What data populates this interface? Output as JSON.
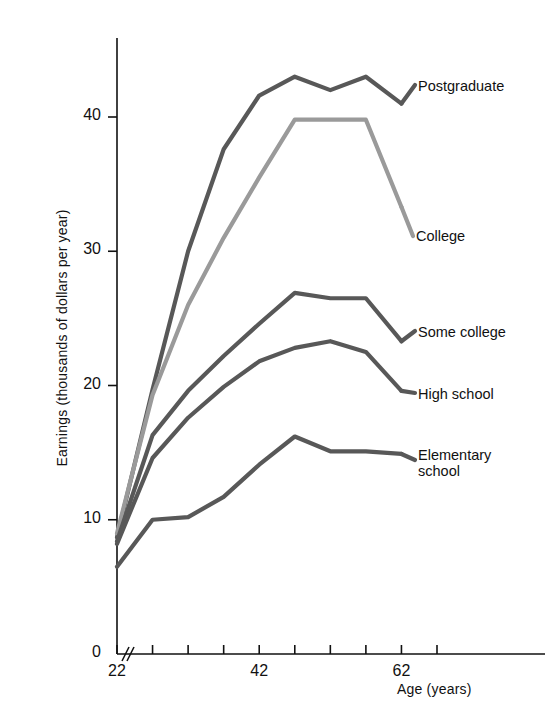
{
  "chart_data": {
    "type": "line",
    "title": "",
    "xlabel": "Age (years)",
    "ylabel": "Earnings (thousands of dollars per year)",
    "xlim": [
      22,
      67
    ],
    "ylim": [
      0,
      46
    ],
    "xticks": [
      22,
      27,
      32,
      37,
      42,
      47,
      52,
      57,
      62,
      67
    ],
    "xtick_labels": [
      "22",
      "",
      "",
      "",
      "42",
      "",
      "",
      "",
      "62",
      ""
    ],
    "yticks": [
      0,
      10,
      20,
      30,
      40
    ],
    "ytick_labels": [
      "0",
      "10",
      "20",
      "30",
      "40"
    ],
    "grid": false,
    "legend_position": "right-inline-labels",
    "axis_break": "//",
    "x": [
      22,
      27,
      32,
      37,
      42,
      47,
      52,
      57,
      62
    ],
    "series": [
      {
        "name": "Postgraduate",
        "color": "#585858",
        "values": [
          8.7,
          19.7,
          30.0,
          37.6,
          41.6,
          43.0,
          42.0,
          43.0,
          41.0
        ]
      },
      {
        "name": "College",
        "color": "#9a9a9a",
        "values": [
          9.0,
          19.3,
          26.0,
          31.0,
          35.5,
          39.8,
          39.8,
          39.8,
          33.3
        ]
      },
      {
        "name": "Some college",
        "color": "#585858",
        "values": [
          8.4,
          16.3,
          19.6,
          22.2,
          24.6,
          26.9,
          26.5,
          26.5,
          23.3
        ]
      },
      {
        "name": "High school",
        "color": "#585858",
        "values": [
          8.2,
          14.6,
          17.6,
          19.9,
          21.8,
          22.8,
          23.3,
          22.5,
          19.6
        ]
      },
      {
        "name": "Elementary school",
        "color": "#585858",
        "values": [
          6.5,
          10.0,
          10.2,
          11.7,
          14.1,
          16.2,
          15.1,
          15.1,
          14.9
        ]
      }
    ]
  },
  "labels": {
    "postgraduate": "Postgraduate",
    "college": "College",
    "some_college": "Some college",
    "high_school": "High school",
    "elementary_line1": "Elementary",
    "elementary_line2": "school"
  }
}
